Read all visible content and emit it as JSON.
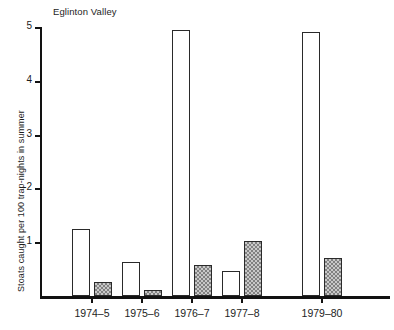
{
  "chart_data": {
    "type": "bar",
    "title": "Eglinton Valley",
    "xlabel": "",
    "ylabel": "Stoats caught per 100 trap-nights in summer",
    "categories": [
      "1974–5",
      "1975–6",
      "1976–7",
      "1977–8",
      "1979–80"
    ],
    "series": [
      {
        "name": "open",
        "fill": "open",
        "values": [
          1.25,
          0.63,
          4.95,
          0.47,
          4.9
        ]
      },
      {
        "name": "shaded",
        "fill": "hatched",
        "values": [
          0.26,
          0.11,
          0.58,
          1.03,
          0.7
        ]
      }
    ],
    "ylim": [
      0,
      5
    ],
    "yticks": [
      1,
      2,
      3,
      4,
      5
    ],
    "ytick_labels": [
      "1",
      "2",
      "3",
      "4",
      "5"
    ],
    "grid": false,
    "legend": "none",
    "colors": {
      "axis": "#121212",
      "bar_outline": "#2a2a2a",
      "open_fill": "#ffffff",
      "shaded_fill": "#c9c9c9",
      "background": "#ffffff",
      "text": "#1d1d1d"
    }
  }
}
